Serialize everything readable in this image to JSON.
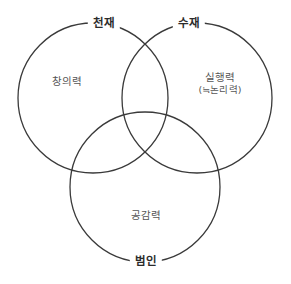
{
  "diagram": {
    "type": "venn",
    "background_color": "#ffffff",
    "stroke_color": "#3a3a3a",
    "stroke_width": 1.3,
    "outer_label_color": "#2b2b2b",
    "inner_label_color": "#565656",
    "sets": [
      {
        "id": "genius",
        "outer_label": "천재",
        "inner_label": "창의력",
        "inner_sub_label": "",
        "cx": 93,
        "cy": 98,
        "r": 75,
        "outer_label_x": 104,
        "outer_label_y": 24,
        "inner_label_x": 67,
        "inner_label_y": 81
      },
      {
        "id": "top-student",
        "outer_label": "수재",
        "inner_label": "실행력",
        "inner_sub_label": "(≒논리력)",
        "cx": 197,
        "cy": 98,
        "r": 75,
        "outer_label_x": 189,
        "outer_label_y": 24,
        "inner_label_x": 220,
        "inner_label_y": 83
      },
      {
        "id": "ordinary-person",
        "outer_label": "범인",
        "inner_label": "공감력",
        "inner_sub_label": "",
        "cx": 145,
        "cy": 187,
        "r": 75,
        "outer_label_x": 146,
        "outer_label_y": 262,
        "inner_label_x": 146,
        "inner_label_y": 215
      }
    ]
  }
}
